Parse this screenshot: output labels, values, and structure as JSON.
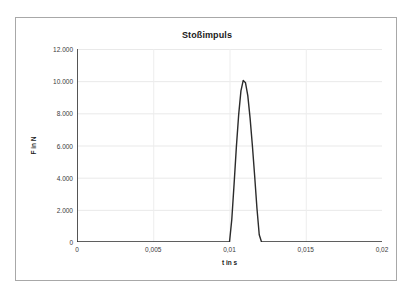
{
  "chart_data": {
    "type": "line",
    "title": "Stoßimpuls",
    "xlabel": "t in s",
    "ylabel": "F in N",
    "xlim": [
      0,
      0.02
    ],
    "ylim": [
      0,
      12000
    ],
    "grid": true,
    "legend": "none",
    "x_ticks": [
      "0",
      "0,005",
      "0,01",
      "0,015",
      "0,02"
    ],
    "x_tick_values": [
      0,
      0.005,
      0.01,
      0.015,
      0.02
    ],
    "y_ticks": [
      "0",
      "2.000",
      "4.000",
      "6.000",
      "8.000",
      "10.000",
      "12.000"
    ],
    "y_tick_values": [
      0,
      2000,
      4000,
      6000,
      8000,
      10000,
      12000
    ],
    "series": [
      {
        "name": "Stoßkraft",
        "color": "#2b2b2b",
        "x": [
          0,
          0.0005,
          0.001,
          0.0015,
          0.002,
          0.0025,
          0.003,
          0.0035,
          0.004,
          0.0045,
          0.005,
          0.0055,
          0.006,
          0.0065,
          0.007,
          0.0075,
          0.008,
          0.0085,
          0.009,
          0.0095,
          0.01,
          0.01015,
          0.0103,
          0.01045,
          0.0106,
          0.01075,
          0.0109,
          0.01105,
          0.0112,
          0.01135,
          0.0115,
          0.01165,
          0.0118,
          0.01195,
          0.0121,
          0.0125,
          0.013,
          0.014,
          0.015,
          0.016,
          0.017,
          0.018,
          0.019,
          0.02
        ],
        "y": [
          0,
          0,
          0,
          0,
          0,
          0,
          0,
          0,
          0,
          0,
          0,
          0,
          0,
          0,
          0,
          0,
          0,
          0,
          0,
          0,
          0,
          1400,
          3600,
          5900,
          7900,
          9400,
          10050,
          9900,
          9100,
          7700,
          6000,
          4100,
          2100,
          450,
          0,
          0,
          0,
          0,
          0,
          0,
          0,
          0,
          0,
          0
        ],
        "peak_value": 10050,
        "peak_time": 0.0109
      }
    ]
  }
}
